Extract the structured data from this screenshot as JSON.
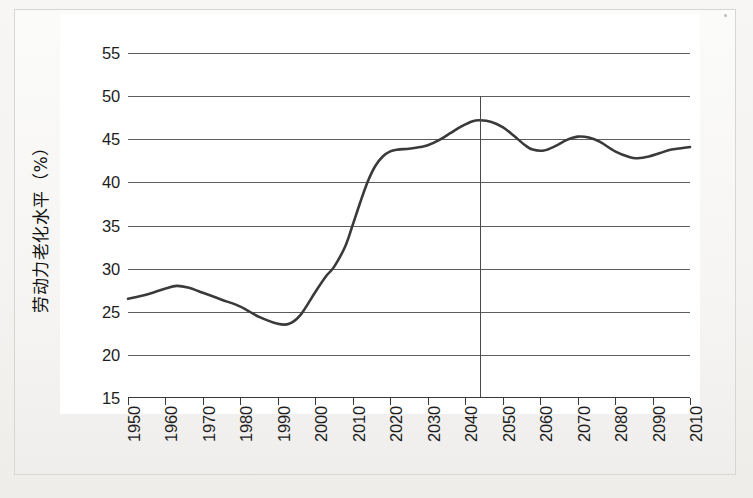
{
  "chart_data": {
    "type": "line",
    "title": "",
    "xlabel": "",
    "ylabel": "劳动力老化水平（%）",
    "xlim": [
      1950,
      2100
    ],
    "ylim": [
      15,
      55
    ],
    "ytick_values": [
      15,
      20,
      25,
      30,
      35,
      40,
      45,
      50,
      55
    ],
    "ytick_labels": [
      "15",
      "20",
      "25",
      "30",
      "35",
      "40",
      "45",
      "50",
      "55"
    ],
    "xtick_values": [
      1950,
      1960,
      1970,
      1980,
      1990,
      2000,
      2010,
      2020,
      2030,
      2040,
      2050,
      2060,
      2070,
      2080,
      2090,
      2100
    ],
    "xtick_labels": [
      "1950",
      "1960",
      "1970",
      "1980",
      "1990",
      "2000",
      "2010",
      "2020",
      "2030",
      "2040",
      "2050",
      "2060",
      "2070",
      "2080",
      "2090",
      "2010"
    ],
    "grid": true,
    "legend": "none",
    "line_color": "#3a3a3a",
    "grid_color": "#5d5d5d",
    "marker_line": {
      "label": "",
      "x_value": 2044,
      "y_top": 50,
      "y_bottom": 15,
      "color": "#4a4a4a"
    },
    "series": [
      {
        "name": "劳动力老化水平",
        "x": [
          1950,
          1955,
          1960,
          1963,
          1966,
          1970,
          1975,
          1980,
          1985,
          1990,
          1993,
          1996,
          2000,
          2003,
          2005,
          2008,
          2010,
          2012,
          2014,
          2016,
          2018,
          2020,
          2022,
          2025,
          2028,
          2030,
          2033,
          2036,
          2039,
          2042,
          2044,
          2047,
          2050,
          2053,
          2056,
          2058,
          2061,
          2064,
          2067,
          2070,
          2073,
          2076,
          2080,
          2084,
          2086,
          2089,
          2092,
          2095,
          2100
        ],
        "y": [
          26.5,
          27.0,
          27.7,
          28.0,
          27.8,
          27.2,
          26.4,
          25.6,
          24.4,
          23.6,
          23.6,
          24.6,
          27.3,
          29.2,
          30.2,
          32.6,
          35.1,
          37.7,
          40.1,
          41.9,
          43.0,
          43.6,
          43.8,
          43.9,
          44.1,
          44.3,
          44.9,
          45.7,
          46.5,
          47.1,
          47.2,
          47.0,
          46.4,
          45.4,
          44.3,
          43.8,
          43.7,
          44.2,
          44.9,
          45.3,
          45.2,
          44.7,
          43.6,
          42.9,
          42.8,
          43.0,
          43.4,
          43.8,
          44.1
        ]
      }
    ]
  },
  "figure": {
    "background_color": "#f4f3f1",
    "plot_background": "#ffffff",
    "border_color": "#d8d6d2"
  }
}
